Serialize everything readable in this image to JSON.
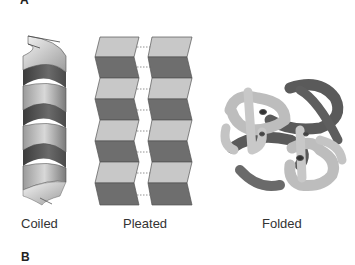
{
  "figure": {
    "panel_a": {
      "label": "A",
      "structures": [
        {
          "id": "coiled",
          "label": "Coiled",
          "icon": "alpha-helix-icon"
        },
        {
          "id": "pleated",
          "label": "Pleated",
          "icon": "beta-sheet-icon"
        },
        {
          "id": "folded",
          "label": "Folded",
          "icon": "folded-protein-icon"
        }
      ]
    },
    "panel_b": {
      "label": "B"
    }
  },
  "colors": {
    "light_gray": "#c8c8c8",
    "dark_gray": "#6e6e6e",
    "outline": "#444444",
    "background": "#ffffff"
  }
}
